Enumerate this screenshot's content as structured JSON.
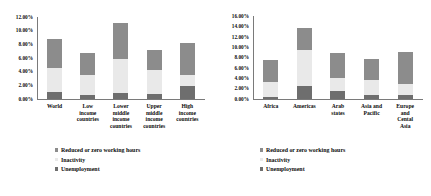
{
  "legend": {
    "items": [
      {
        "key": "reduced",
        "label": "Reduced or zero working hours",
        "color": "#8c8c8c"
      },
      {
        "key": "inactivity",
        "label": "Inactivity",
        "color": "#e9e9e9"
      },
      {
        "key": "unemployment",
        "label": "Unemployment",
        "color": "#6e6e6e"
      }
    ]
  },
  "chart_data": [
    {
      "id": "by-income-group",
      "type": "bar",
      "stacked": true,
      "title": "",
      "xlabel": "",
      "ylabel": "",
      "ylim": [
        0,
        12
      ],
      "yunit": "%",
      "ytick_labels": [
        "12.00%",
        "10.00%",
        "8.00%",
        "6.00%",
        "4.00%",
        "2.00%",
        "0.00%"
      ],
      "ytick_values": [
        12,
        10,
        8,
        6,
        4,
        2,
        0
      ],
      "grid": false,
      "legend_position": "bottom-left",
      "categories": [
        "World",
        "Low income countries",
        "Lower middle income countries",
        "Upper middle income countries",
        "High income countries"
      ],
      "category_lines": [
        [
          "World"
        ],
        [
          "Low",
          "income",
          "countries"
        ],
        [
          "Lower",
          "middle",
          "income",
          "countries"
        ],
        [
          "Upper",
          "middle",
          "income",
          "countries"
        ],
        [
          "High",
          "income",
          "countries"
        ]
      ],
      "series": [
        {
          "name": "Unemployment",
          "color": "#6e6e6e",
          "values": [
            1.0,
            0.6,
            0.9,
            0.7,
            1.9
          ]
        },
        {
          "name": "Inactivity",
          "color": "#e9e9e9",
          "values": [
            3.5,
            2.9,
            4.9,
            3.6,
            1.6
          ]
        },
        {
          "name": "Reduced or zero working hours",
          "color": "#8c8c8c",
          "values": [
            4.3,
            3.2,
            5.4,
            2.9,
            4.7
          ]
        }
      ],
      "totals": [
        8.8,
        6.7,
        11.2,
        7.2,
        8.2
      ]
    },
    {
      "id": "by-region",
      "type": "bar",
      "stacked": true,
      "title": "",
      "xlabel": "",
      "ylabel": "",
      "ylim": [
        0,
        16
      ],
      "yunit": "%",
      "ytick_labels": [
        "16.00%",
        "14.00%",
        "12.00%",
        "10.00%",
        "8.00%",
        "6.00%",
        "4.00%",
        "2.00%",
        "0.00%"
      ],
      "ytick_values": [
        16,
        14,
        12,
        10,
        8,
        6,
        4,
        2,
        0
      ],
      "grid": false,
      "legend_position": "bottom-left",
      "categories": [
        "Africa",
        "Americas",
        "Arab states",
        "Asia and Pacific",
        "Europe and Cental Asia"
      ],
      "category_lines": [
        [
          "Africa"
        ],
        [
          "Americas"
        ],
        [
          "Arab",
          "states"
        ],
        [
          "Asia and",
          "Pacific"
        ],
        [
          "Europe",
          "and",
          "Cental",
          "Asia"
        ]
      ],
      "series": [
        {
          "name": "Unemployment",
          "color": "#6e6e6e",
          "values": [
            0.4,
            2.5,
            1.5,
            0.8,
            0.8
          ]
        },
        {
          "name": "Inactivity",
          "color": "#e9e9e9",
          "values": [
            2.8,
            7.0,
            2.6,
            2.8,
            2.1
          ]
        },
        {
          "name": "Reduced or zero working hours",
          "color": "#8c8c8c",
          "values": [
            4.3,
            4.2,
            4.8,
            4.2,
            6.1
          ]
        }
      ],
      "totals": [
        7.5,
        13.7,
        8.9,
        7.8,
        9.0
      ]
    }
  ]
}
